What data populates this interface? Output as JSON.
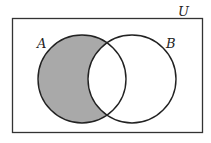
{
  "diagram": {
    "type": "venn",
    "universe_label": "U",
    "sets": [
      {
        "label": "A",
        "cx": 82,
        "cy": 79,
        "r": 44
      },
      {
        "label": "B",
        "cx": 132,
        "cy": 79,
        "r": 44
      }
    ],
    "shaded_region": "A minus B",
    "colors": {
      "shade": "#a9a9a9",
      "stroke": "#222222",
      "background": "#ffffff"
    }
  }
}
